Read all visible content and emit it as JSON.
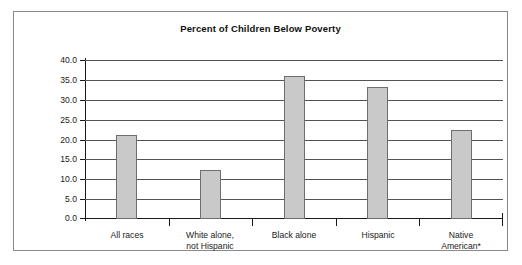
{
  "chart_data": {
    "type": "bar",
    "title": "Percent of Children Below Poverty",
    "xlabel": "",
    "ylabel": "",
    "ylim": [
      0.0,
      40.0
    ],
    "ytick_step": 5.0,
    "ytick_labels": [
      "40.0",
      "35.0",
      "30.0",
      "25.0",
      "20.0",
      "15.0",
      "10.0",
      "5.0",
      "0.0"
    ],
    "ytick_values": [
      40.0,
      35.0,
      30.0,
      25.0,
      20.0,
      15.0,
      10.0,
      5.0,
      0.0
    ],
    "grid": true,
    "legend": false,
    "categories": [
      "All races",
      "White alone, not Hispanic",
      "Black alone",
      "Hispanic",
      "Native American*"
    ],
    "category_lines": [
      [
        "All races"
      ],
      [
        "White alone,",
        "not Hispanic"
      ],
      [
        "Black alone"
      ],
      [
        "Hispanic"
      ],
      [
        "Native",
        "American*"
      ]
    ],
    "values": [
      21.1,
      12.3,
      35.9,
      33.1,
      22.5
    ],
    "bar_fill_color": "#c9c9c9",
    "bar_border_color": "#6e6e6e",
    "gridline_color": "#555555",
    "axis_color": "#1a1a1a",
    "frame_color": "#8a8a8a",
    "background_color": "#ffffff"
  }
}
